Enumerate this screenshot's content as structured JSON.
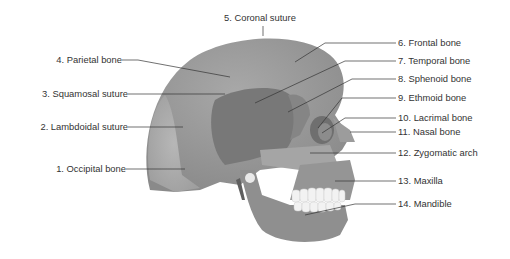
{
  "diagram": {
    "labels": [
      {
        "id": 1,
        "text": "1. Occipital bone"
      },
      {
        "id": 2,
        "text": "2. Lambdoidal suture"
      },
      {
        "id": 3,
        "text": "3. Squamosal suture"
      },
      {
        "id": 4,
        "text": "4. Parietal bone"
      },
      {
        "id": 5,
        "text": "5. Coronal suture"
      },
      {
        "id": 6,
        "text": "6. Frontal bone"
      },
      {
        "id": 7,
        "text": "7. Temporal bone"
      },
      {
        "id": 8,
        "text": "8. Sphenoid bone"
      },
      {
        "id": 9,
        "text": "9. Ethmoid bone"
      },
      {
        "id": 10,
        "text": "10. Lacrimal bone"
      },
      {
        "id": 11,
        "text": "11. Nasal bone"
      },
      {
        "id": 12,
        "text": "12. Zygomatic arch"
      },
      {
        "id": 13,
        "text": "13. Maxilla"
      },
      {
        "id": 14,
        "text": "14. Mandible"
      }
    ],
    "colors": {
      "bone": "#9a9a9a",
      "bone_light": "#b8b8b8",
      "temporal": "#7a7a7a",
      "teeth": "#f2f2f2",
      "leader_line": "#333333",
      "text": "#333333"
    }
  }
}
